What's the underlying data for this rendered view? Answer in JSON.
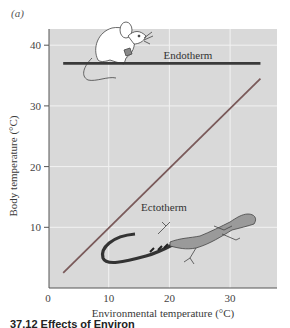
{
  "panel_label": "(a)",
  "caption": "37.12  Effects of Environ",
  "chart_data": {
    "type": "line",
    "title": "",
    "xlabel": "Environmental temperature (°C)",
    "ylabel": "Body temperature (°C)",
    "xlim": [
      0,
      37
    ],
    "ylim": [
      0,
      43
    ],
    "x_ticks": [
      0,
      10,
      20,
      30
    ],
    "y_ticks": [
      10,
      20,
      30,
      40
    ],
    "grid": true,
    "legend": "none (inline labels)",
    "series": [
      {
        "name": "Endotherm",
        "label": "Endotherm",
        "color": "#3a3a3a",
        "x": [
          2.5,
          35
        ],
        "y": [
          37,
          37
        ],
        "illustration": "mouse"
      },
      {
        "name": "Ectotherm",
        "label": "Ectotherm",
        "color": "#7a5a5a",
        "x": [
          2.5,
          35
        ],
        "y": [
          2.5,
          34.5
        ],
        "illustration": "lizard"
      }
    ],
    "colors": {
      "plot_background": "#d9d9d9",
      "gridline": "#f2f2f2",
      "axis": "#555555"
    }
  }
}
